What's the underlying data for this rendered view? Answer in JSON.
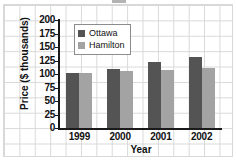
{
  "chart_data": {
    "type": "bar",
    "title": "",
    "xlabel": "Year",
    "ylabel": "Price ($ thousands)",
    "categories": [
      "1999",
      "2000",
      "2001",
      "2002"
    ],
    "series": [
      {
        "name": "Ottawa",
        "color": "#545454",
        "values": [
          101,
          110,
          123,
          132
        ]
      },
      {
        "name": "Hamilton",
        "color": "#a3a3a3",
        "values": [
          102,
          106,
          107,
          112
        ]
      }
    ],
    "ylim": [
      0,
      200
    ],
    "yticks": [
      0,
      25,
      50,
      75,
      100,
      125,
      150,
      175,
      200
    ],
    "ytick_labels": [
      "0",
      "25",
      "50",
      "75",
      "100",
      "125",
      "150",
      "175",
      "200"
    ],
    "grid": true,
    "grid_style": "graph-paper-background",
    "legend_position": "upper-center-inside"
  },
  "legend": {
    "entries": [
      {
        "label": "Ottawa",
        "color": "#545454"
      },
      {
        "label": "Hamilton",
        "color": "#a3a3a3"
      }
    ]
  },
  "axes": {
    "y_title": "Price ($ thousands)",
    "x_title": "Year"
  },
  "colors": {
    "ottawa": "#545454",
    "hamilton": "#a3a3a3",
    "axis": "#1a1a1a",
    "grid": "#d8d8d8",
    "page_background": "#ffffff"
  }
}
